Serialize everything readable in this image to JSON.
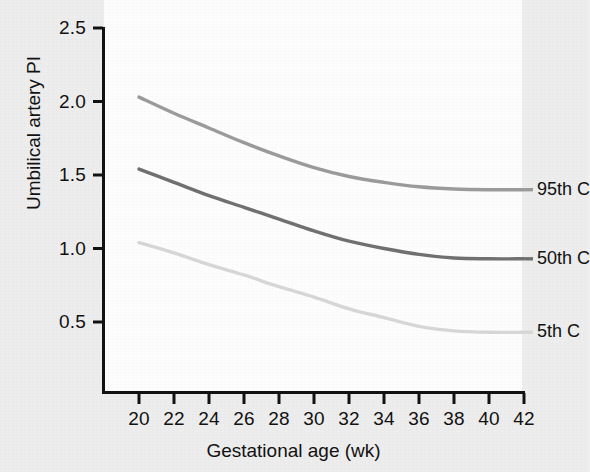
{
  "figure": {
    "background_color": "#ededed",
    "panel_color": "#fdfdfd",
    "axis_color": "#121212"
  },
  "chart_data": {
    "type": "line",
    "title": "",
    "xlabel": "Gestational age (wk)",
    "ylabel": "Umbilical artery PI",
    "xlim": [
      20,
      42
    ],
    "ylim": [
      0.25,
      2.5
    ],
    "xticks": [
      20,
      22,
      24,
      26,
      28,
      30,
      32,
      34,
      36,
      38,
      40,
      42
    ],
    "xtick_labels": [
      "20",
      "22",
      "24",
      "26",
      "28",
      "30",
      "32",
      "34",
      "36",
      "38",
      "40",
      "42"
    ],
    "yticks": [
      0.5,
      1.0,
      1.5,
      2.0,
      2.5
    ],
    "ytick_labels": [
      "0.5",
      "1.0",
      "1.5",
      "2.0",
      "2.5"
    ],
    "grid": false,
    "legend_position": "right-of-axes-inline",
    "x": [
      20,
      22,
      24,
      26,
      28,
      30,
      32,
      34,
      36,
      38,
      40,
      42
    ],
    "series": [
      {
        "name": "95th C",
        "color": "#9a9a9a",
        "values": [
          2.03,
          1.92,
          1.82,
          1.72,
          1.63,
          1.55,
          1.49,
          1.45,
          1.42,
          1.405,
          1.4,
          1.4
        ]
      },
      {
        "name": "50th C",
        "color": "#707070",
        "values": [
          1.54,
          1.45,
          1.36,
          1.28,
          1.2,
          1.12,
          1.05,
          1.0,
          0.96,
          0.935,
          0.93,
          0.93
        ]
      },
      {
        "name": "5th C",
        "color": "#d6d6d6",
        "values": [
          1.04,
          0.97,
          0.89,
          0.82,
          0.74,
          0.67,
          0.59,
          0.53,
          0.47,
          0.44,
          0.43,
          0.43
        ]
      }
    ]
  },
  "axes": {
    "y_title": "Umbilical artery PI",
    "x_title": "Gestational age (wk)"
  },
  "legend": {
    "items": [
      {
        "label": "95th C"
      },
      {
        "label": "50th C"
      },
      {
        "label": "5th C"
      }
    ]
  }
}
